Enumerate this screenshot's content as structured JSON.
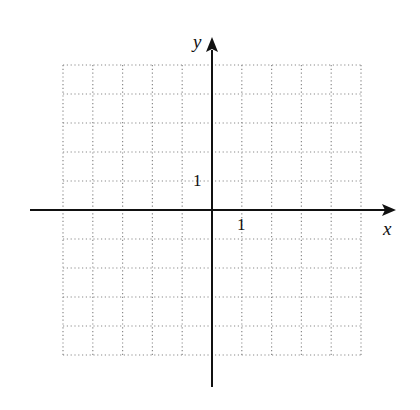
{
  "figure": {
    "type": "coordinate-grid",
    "grid": {
      "columns": 10,
      "rows": 10,
      "style": "dotted",
      "color": "#8a8a8a",
      "x_range": [
        -5,
        5
      ],
      "y_range": [
        -5,
        5
      ]
    },
    "axes": {
      "color": "#111111",
      "x_label": "x",
      "y_label": "y"
    },
    "tick_labels": {
      "x_unit": "1",
      "y_unit": "1"
    }
  }
}
